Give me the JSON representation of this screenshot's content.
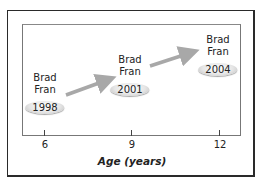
{
  "diagram": {
    "axis": {
      "title": "Age (years)",
      "ticks": [
        "6",
        "9",
        "12"
      ]
    },
    "groups": [
      {
        "names": [
          "Brad",
          "Fran"
        ],
        "year": "1998",
        "age": "6"
      },
      {
        "names": [
          "Brad",
          "Fran"
        ],
        "year": "2001",
        "age": "9"
      },
      {
        "names": [
          "Brad",
          "Fran"
        ],
        "year": "2004",
        "age": "12"
      }
    ],
    "arrow_color": "#a8a8a8"
  }
}
